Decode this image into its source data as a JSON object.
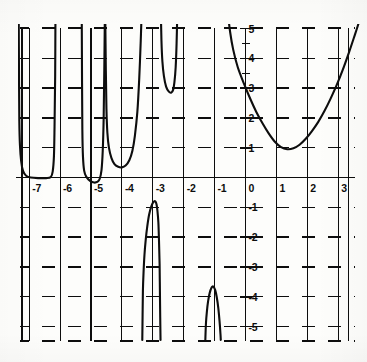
{
  "figure": {
    "title": "",
    "background_color": "#fdfdfb",
    "ink_color": "#0d0d0d"
  },
  "chart_data": {
    "type": "line",
    "title": "",
    "xlabel": "",
    "ylabel": "",
    "xlim": [
      -7.6,
      3.9
    ],
    "ylim": [
      -5.45,
      5.6
    ],
    "grid": true,
    "grid_style": "horizontal-dashed-vertical-solid",
    "legend": "none",
    "x_ticks": [
      -7,
      -6,
      -5,
      -4,
      -3,
      -2,
      -1,
      0,
      1,
      2,
      3
    ],
    "x_tick_labels": [
      "-7",
      "-6",
      "-5",
      "-4",
      "-3",
      "-2",
      "-1",
      "0",
      "1",
      "2",
      "3"
    ],
    "y_ticks": [
      5,
      4,
      3,
      2,
      1,
      -1,
      -2,
      -3,
      -4,
      -5
    ],
    "y_tick_labels": [
      "5",
      "4",
      "3",
      "2",
      "1",
      "-1",
      "-2",
      "-3",
      "-4",
      "-5"
    ],
    "asymptotes": [
      -7.35,
      -6.15,
      -5.3,
      -4.55,
      -3.35,
      -2.75,
      -2.2,
      -1.55,
      -1.25,
      -0.6
    ],
    "series": [
      {
        "name": "branch-1",
        "comment": "U branch between x=-7.35 and x=-6.15, vertex on the x-axis",
        "points": [
          [
            -7.34,
            5.6
          ],
          [
            -7.33,
            3.4
          ],
          [
            -7.32,
            1.9
          ],
          [
            -7.3,
            1.1
          ],
          [
            -7.26,
            0.55
          ],
          [
            -7.2,
            0.22
          ],
          [
            -7.1,
            0.06
          ],
          [
            -6.95,
            0.0
          ],
          [
            -6.7,
            -0.02
          ],
          [
            -6.45,
            -0.02
          ],
          [
            -6.3,
            0.02
          ],
          [
            -6.24,
            0.2
          ],
          [
            -6.2,
            0.7
          ],
          [
            -6.18,
            1.7
          ],
          [
            -6.16,
            3.4
          ],
          [
            -6.15,
            5.6
          ]
        ]
      },
      {
        "name": "branch-2",
        "comment": "Shallow dip just below the axis between x=-5.3 and x=-4.55",
        "points": [
          [
            -5.3,
            5.6
          ],
          [
            -5.29,
            3.2
          ],
          [
            -5.28,
            1.6
          ],
          [
            -5.26,
            0.7
          ],
          [
            -5.22,
            0.22
          ],
          [
            -5.15,
            0.02
          ],
          [
            -5.02,
            -0.12
          ],
          [
            -4.9,
            -0.17
          ],
          [
            -4.8,
            -0.15
          ],
          [
            -4.72,
            -0.05
          ],
          [
            -4.66,
            0.25
          ],
          [
            -4.62,
            0.9
          ],
          [
            -4.59,
            2.0
          ],
          [
            -4.57,
            3.6
          ],
          [
            -4.55,
            5.6
          ]
        ]
      },
      {
        "name": "branch-3",
        "comment": "Deep U between x=-4.55 and x=-3.35 with minimum near y=0.35",
        "points": [
          [
            -4.54,
            5.6
          ],
          [
            -4.52,
            3.6
          ],
          [
            -4.5,
            2.3
          ],
          [
            -4.47,
            1.5
          ],
          [
            -4.42,
            1.0
          ],
          [
            -4.34,
            0.66
          ],
          [
            -4.24,
            0.45
          ],
          [
            -4.12,
            0.36
          ],
          [
            -4.0,
            0.34
          ],
          [
            -3.88,
            0.4
          ],
          [
            -3.76,
            0.58
          ],
          [
            -3.66,
            0.9
          ],
          [
            -3.58,
            1.4
          ],
          [
            -3.5,
            2.2
          ],
          [
            -3.44,
            3.3
          ],
          [
            -3.39,
            4.6
          ],
          [
            -3.36,
            5.6
          ]
        ]
      },
      {
        "name": "branch-4",
        "comment": "Narrow U between x=-2.75 and x=-2.2 with minimum near y=2.85",
        "points": [
          [
            -2.74,
            5.6
          ],
          [
            -2.72,
            4.6
          ],
          [
            -2.69,
            3.9
          ],
          [
            -2.64,
            3.4
          ],
          [
            -2.57,
            3.05
          ],
          [
            -2.48,
            2.88
          ],
          [
            -2.4,
            2.85
          ],
          [
            -2.34,
            2.95
          ],
          [
            -2.3,
            3.2
          ],
          [
            -2.26,
            3.7
          ],
          [
            -2.23,
            4.5
          ],
          [
            -2.21,
            5.4
          ],
          [
            -2.2,
            5.6
          ]
        ]
      },
      {
        "name": "branch-5",
        "comment": "Right-hand U branch starting near x=-0.6 descending from top, minimum near (1.2, 0.9), rising past x=3.8",
        "points": [
          [
            -0.58,
            5.6
          ],
          [
            -0.5,
            4.9
          ],
          [
            -0.4,
            4.3
          ],
          [
            -0.25,
            3.7
          ],
          [
            -0.05,
            3.15
          ],
          [
            0.15,
            2.65
          ],
          [
            0.35,
            2.2
          ],
          [
            0.55,
            1.82
          ],
          [
            0.75,
            1.48
          ],
          [
            0.95,
            1.2
          ],
          [
            1.15,
            1.02
          ],
          [
            1.35,
            0.95
          ],
          [
            1.55,
            0.98
          ],
          [
            1.75,
            1.1
          ],
          [
            1.95,
            1.3
          ],
          [
            2.15,
            1.56
          ],
          [
            2.35,
            1.86
          ],
          [
            2.55,
            2.22
          ],
          [
            2.75,
            2.64
          ],
          [
            2.95,
            3.1
          ],
          [
            3.15,
            3.62
          ],
          [
            3.35,
            4.2
          ],
          [
            3.55,
            4.82
          ],
          [
            3.75,
            5.45
          ],
          [
            3.85,
            5.6
          ]
        ]
      },
      {
        "name": "branch-6",
        "comment": "Inverted arch below the axis between x=-3.35 and x=-2.75, peak near (-3.0, -0.8)",
        "points": [
          [
            -3.34,
            -5.45
          ],
          [
            -3.33,
            -4.6
          ],
          [
            -3.32,
            -3.8
          ],
          [
            -3.3,
            -3.2
          ],
          [
            -3.27,
            -2.6
          ],
          [
            -3.23,
            -2.1
          ],
          [
            -3.18,
            -1.65
          ],
          [
            -3.12,
            -1.25
          ],
          [
            -3.05,
            -0.98
          ],
          [
            -2.98,
            -0.82
          ],
          [
            -2.92,
            -0.8
          ],
          [
            -2.88,
            -0.9
          ],
          [
            -2.85,
            -1.12
          ],
          [
            -2.82,
            -1.5
          ],
          [
            -2.8,
            -2.1
          ],
          [
            -2.78,
            -2.9
          ],
          [
            -2.77,
            -3.8
          ],
          [
            -2.76,
            -4.7
          ],
          [
            -2.75,
            -5.45
          ]
        ]
      },
      {
        "name": "branch-7",
        "comment": "Small inverted arch below the axis between x=-1.55 and x=-1.25, peak near (-1.05, -3.65)",
        "points": [
          [
            -1.3,
            -5.45
          ],
          [
            -1.28,
            -4.9
          ],
          [
            -1.25,
            -4.5
          ],
          [
            -1.21,
            -4.15
          ],
          [
            -1.16,
            -3.88
          ],
          [
            -1.1,
            -3.7
          ],
          [
            -1.04,
            -3.66
          ],
          [
            -0.98,
            -3.78
          ],
          [
            -0.93,
            -4.02
          ],
          [
            -0.88,
            -4.38
          ],
          [
            -0.84,
            -4.82
          ],
          [
            -0.81,
            -5.25
          ],
          [
            -0.8,
            -5.45
          ]
        ]
      }
    ]
  },
  "axes": {
    "x_axis_name": "x-axis",
    "y_axis_name": "y-axis"
  }
}
